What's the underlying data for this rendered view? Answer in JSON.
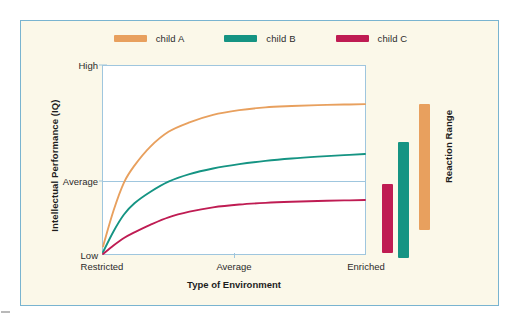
{
  "figure": {
    "background_color": "#fbf8e9",
    "border_color": "#79b4d0",
    "plot_background": "#ffffff",
    "axis_color": "#9fc6de"
  },
  "legend": {
    "items": [
      {
        "label": "child A",
        "color": "#e8a05e"
      },
      {
        "label": "child B",
        "color": "#159483"
      },
      {
        "label": "child C",
        "color": "#bf1c53"
      }
    ]
  },
  "reaction_range": {
    "title": "Reaction Range",
    "bars": [
      {
        "name": "child C",
        "color": "#bf1c53",
        "top_pct": 62.6,
        "bottom_pct": 99.0
      },
      {
        "name": "child B",
        "color": "#159483",
        "top_pct": 40.5,
        "bottom_pct": 101.5
      },
      {
        "name": "child A",
        "color": "#e8a05e",
        "top_pct": 20.3,
        "bottom_pct": 87.0
      }
    ]
  },
  "chart_data": {
    "type": "line",
    "title": "",
    "subtitle": "",
    "xlabel": "Type of Environment",
    "ylabel": "Intellectual Performance (IQ)",
    "xtick_labels": [
      "Restricted",
      "Average",
      "Enriched"
    ],
    "ytick_labels": [
      "Low",
      "Average",
      "High"
    ],
    "xlim": [
      0,
      1
    ],
    "ylim": [
      0,
      1
    ],
    "grid": "average-line-only",
    "legend_position": "top-center",
    "annotations": [
      "Reaction Range"
    ],
    "series": [
      {
        "name": "child A",
        "color": "#e8a05e",
        "x": [
          0.0,
          0.04,
          0.08,
          0.12,
          0.18,
          0.25,
          0.33,
          0.42,
          0.52,
          0.62,
          0.72,
          0.82,
          0.92,
          1.0
        ],
        "y": [
          0.04,
          0.23,
          0.38,
          0.47,
          0.57,
          0.65,
          0.7,
          0.74,
          0.765,
          0.78,
          0.787,
          0.792,
          0.795,
          0.797
        ]
      },
      {
        "name": "child B",
        "color": "#159483",
        "x": [
          0.0,
          0.04,
          0.08,
          0.12,
          0.18,
          0.25,
          0.33,
          0.42,
          0.52,
          0.62,
          0.72,
          0.82,
          0.92,
          1.0
        ],
        "y": [
          0.01,
          0.12,
          0.21,
          0.27,
          0.33,
          0.385,
          0.425,
          0.455,
          0.478,
          0.495,
          0.508,
          0.518,
          0.526,
          0.532
        ]
      },
      {
        "name": "child C",
        "color": "#bf1c53",
        "x": [
          0.0,
          0.04,
          0.08,
          0.12,
          0.18,
          0.25,
          0.33,
          0.42,
          0.52,
          0.62,
          0.72,
          0.82,
          0.92,
          1.0
        ],
        "y": [
          0.0,
          0.045,
          0.085,
          0.115,
          0.155,
          0.195,
          0.225,
          0.248,
          0.263,
          0.272,
          0.278,
          0.282,
          0.285,
          0.287
        ]
      }
    ]
  }
}
